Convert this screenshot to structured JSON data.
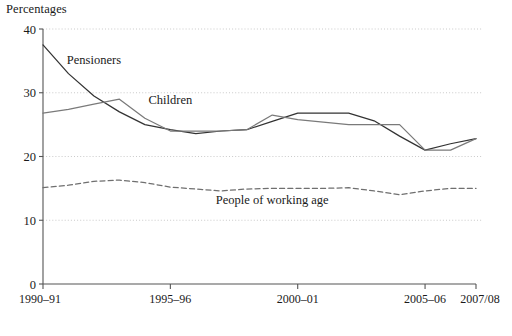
{
  "chart_data": {
    "type": "line",
    "title": "Percentages",
    "xlabel": "",
    "ylabel": "",
    "ylim": [
      0,
      40
    ],
    "ytick_values": [
      0,
      10,
      20,
      30,
      40
    ],
    "ytick_labels": [
      "0",
      "10",
      "20",
      "30",
      "40"
    ],
    "grid": true,
    "gridlines_y": [
      10,
      20,
      30,
      40
    ],
    "legend_position": "inline-annotations",
    "x": [
      "1990-91",
      "1991-92",
      "1992-93",
      "1993-94",
      "1994-95",
      "1995-96",
      "1996-97",
      "1997-98",
      "1998-99",
      "1999-00",
      "2000-01",
      "2001-02",
      "2002-03",
      "2003-04",
      "2004-05",
      "2005-06",
      "2006-07",
      "2007/08"
    ],
    "xtick_labels": [
      "1990–91",
      "1995–96",
      "2000–01",
      "2005–06",
      "2007/08"
    ],
    "xtick_positions": [
      "1990-91",
      "1995-96",
      "2000-01",
      "2005-06",
      "2007/08"
    ],
    "series": [
      {
        "name": "Pensioners",
        "style": "solid",
        "color": "#333333",
        "label_x": "1992-93",
        "label_y": 34.5,
        "values": [
          37.5,
          33.0,
          29.5,
          27.0,
          25.0,
          24.2,
          23.6,
          24.0,
          24.2,
          25.5,
          26.8,
          26.8,
          26.8,
          25.6,
          23.2,
          21.0,
          22.0,
          22.8
        ]
      },
      {
        "name": "Children",
        "style": "solid",
        "color": "#7a7a7a",
        "label_x": "1995-96",
        "label_y": 28.2,
        "values": [
          26.8,
          27.4,
          28.2,
          29.0,
          26.0,
          24.0,
          24.0,
          24.0,
          24.2,
          26.5,
          25.8,
          25.4,
          25.0,
          25.0,
          25.0,
          21.0,
          21.0,
          22.8
        ]
      },
      {
        "name": "People of working age",
        "style": "dashed",
        "color": "#6f6f6f",
        "label_x": "1999-00",
        "label_y": 12.6,
        "values": [
          15.1,
          15.5,
          16.1,
          16.3,
          15.9,
          15.2,
          14.9,
          14.6,
          14.9,
          15.0,
          15.0,
          15.0,
          15.1,
          14.6,
          14.0,
          14.6,
          15.0,
          15.0
        ]
      }
    ]
  },
  "axes": {
    "y_title": "Percentages"
  }
}
